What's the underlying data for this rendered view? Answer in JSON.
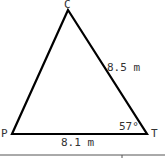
{
  "diagram": {
    "type": "triangle",
    "vertices": {
      "C": {
        "label": "C"
      },
      "P": {
        "label": "P"
      },
      "T": {
        "label": "T"
      }
    },
    "sides": {
      "CT": {
        "label": "8.5 m"
      },
      "PT": {
        "label": "8.1 m"
      }
    },
    "angles": {
      "T": {
        "label": "57°"
      }
    },
    "colors": {
      "stroke": "#000000",
      "text": "#333333"
    }
  }
}
